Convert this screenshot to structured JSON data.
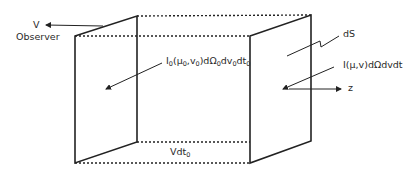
{
  "labels": {
    "v": "V",
    "observer": "Observer",
    "inner_intensity_main": "I",
    "inner_intensity_parts": [
      "0",
      "(μ",
      "0",
      ",v",
      "0",
      ")dΩ",
      "0",
      "dv",
      "0",
      "dt",
      "0"
    ],
    "ds": "dS",
    "outer_intensity": "I(μ,v)dΩdvdt",
    "z_axis": "z",
    "vdt_main": "Vdt",
    "vdt_sub": "0"
  },
  "colors": {
    "line": "#222222",
    "text": "#2a2a2a",
    "background": "#ffffff"
  }
}
